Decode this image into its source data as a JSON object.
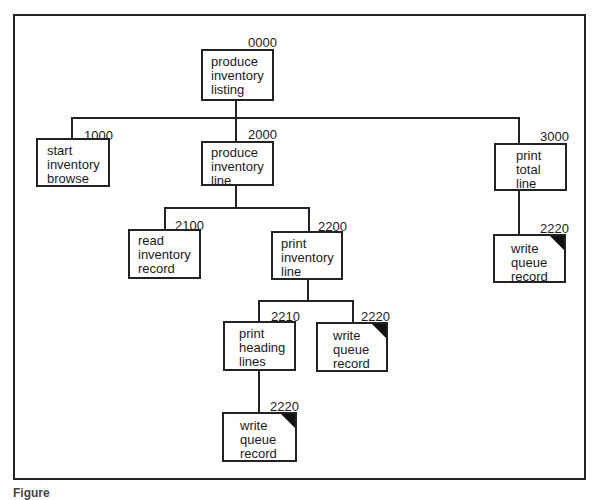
{
  "diagram": {
    "type": "structure-chart",
    "nodes": [
      {
        "id": "0000",
        "lines": [
          "produce",
          "inventory",
          "listing"
        ],
        "library_module": false
      },
      {
        "id": "1000",
        "lines": [
          "start",
          "inventory",
          "browse"
        ],
        "library_module": false
      },
      {
        "id": "2000",
        "lines": [
          "produce",
          "inventory",
          "line"
        ],
        "library_module": false
      },
      {
        "id": "3000",
        "lines": [
          "print",
          "total",
          "line"
        ],
        "library_module": false
      },
      {
        "id": "2100",
        "lines": [
          "read",
          "inventory",
          "record"
        ],
        "library_module": false
      },
      {
        "id": "2200",
        "lines": [
          "print",
          "inventory",
          "line"
        ],
        "library_module": false
      },
      {
        "id": "2220",
        "lines": [
          "write",
          "queue",
          "record"
        ],
        "library_module": true,
        "parent": "3000"
      },
      {
        "id": "2210",
        "lines": [
          "print",
          "heading",
          "lines"
        ],
        "library_module": false
      },
      {
        "id": "2220",
        "lines": [
          "write",
          "queue",
          "record"
        ],
        "library_module": true,
        "parent": "2200"
      },
      {
        "id": "2220",
        "lines": [
          "write",
          "queue",
          "record"
        ],
        "library_module": true,
        "parent": "2210"
      }
    ],
    "edges": [
      [
        "0000",
        "1000"
      ],
      [
        "0000",
        "2000"
      ],
      [
        "0000",
        "3000"
      ],
      [
        "2000",
        "2100"
      ],
      [
        "2000",
        "2200"
      ],
      [
        "3000",
        "2220"
      ],
      [
        "2200",
        "2210"
      ],
      [
        "2200",
        "2220"
      ],
      [
        "2210",
        "2220"
      ]
    ]
  },
  "caption": "Figure"
}
